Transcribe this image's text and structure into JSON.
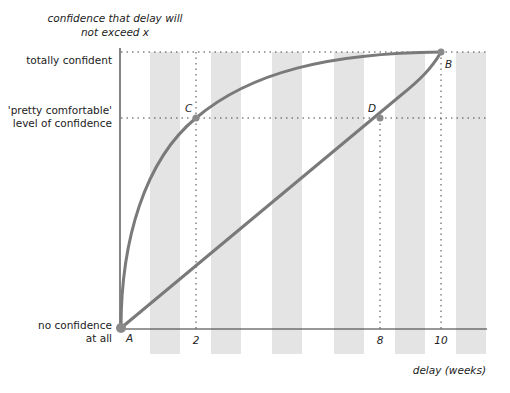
{
  "diagram": {
    "y_axis_title_line1": "confidence that delay will",
    "y_axis_title_line2": "not exceed  x",
    "x_axis_title": "delay (weeks)",
    "y_labels": {
      "top": "totally confident",
      "mid_line1": "'pretty comfortable'",
      "mid_line2": "level of confidence",
      "bottom_line1": "no confidence",
      "bottom_line2": "at all"
    },
    "x_ticks": [
      "2",
      "8",
      "10"
    ],
    "points": {
      "A": "A",
      "B": "B",
      "C": "C",
      "D": "D"
    },
    "colors": {
      "curve": "#7a7a7a",
      "stripe": "#e4e4e4",
      "axis": "#333333",
      "point": "#8a8a8a"
    }
  }
}
